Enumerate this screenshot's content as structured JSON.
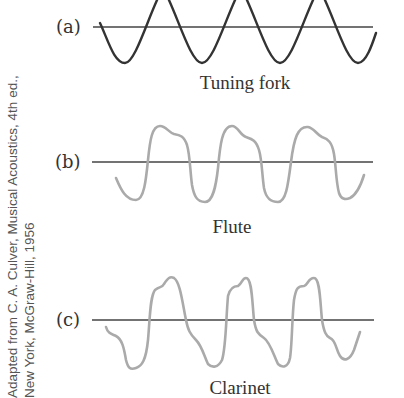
{
  "panels": [
    {
      "id": "a",
      "label": "(a)",
      "caption": "Tuning fork",
      "stroke": "#333333"
    },
    {
      "id": "b",
      "label": "(b)",
      "caption": "Flute",
      "stroke": "#a8a8a8"
    },
    {
      "id": "c",
      "label": "(c)",
      "caption": "Clarinet",
      "stroke": "#a8a8a8"
    }
  ],
  "credit": {
    "line1": "Adapted from C. A. Culver, Musical Acoustics, 4th ed.,",
    "line2": "New York, McGraw-Hill, 1956"
  },
  "colors": {
    "axis": "#333333",
    "text": "#333333",
    "credit": "#555555"
  }
}
